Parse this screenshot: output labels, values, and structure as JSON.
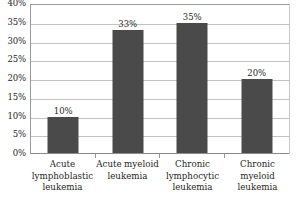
{
  "chart_data": {
    "type": "bar",
    "title": "",
    "subtitle": "",
    "xlabel": "",
    "ylabel": "",
    "categories": [
      "Acute lymphoblastic leukemia",
      "Acute myeloid leukemia",
      "Chronic lymphocytic leukemia",
      "Chronic myeloid leukemia"
    ],
    "values": [
      10,
      33,
      35,
      20
    ],
    "value_labels": [
      "10%",
      "33%",
      "35%",
      "20%"
    ],
    "ylim": [
      0,
      40
    ],
    "ytick_values": [
      40,
      35,
      30,
      25,
      20,
      15,
      10,
      5,
      0
    ],
    "ytick_labels": [
      "40%",
      "35%",
      "30%",
      "25%",
      "20%",
      "15%",
      "10%",
      "5%",
      "0%"
    ],
    "grid": true,
    "legend": false,
    "legend_position": "none",
    "bar_color": "#4a4a4a",
    "gridline_color": "#c2c2c2",
    "axis_color": "#8a8a8a",
    "background_color": "#ffffff",
    "text_color": "#1f1f1f"
  }
}
